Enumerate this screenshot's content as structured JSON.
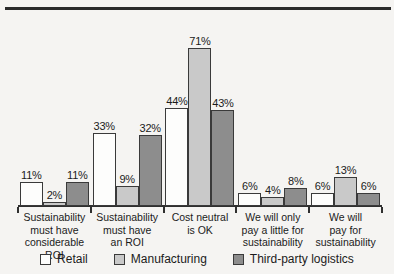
{
  "chart_data": {
    "type": "bar",
    "title": "",
    "subtitle": "",
    "xlabel": "",
    "ylabel": "",
    "grid": false,
    "legend_position": "bottom",
    "ylim": [
      0,
      80
    ],
    "value_suffix": "%",
    "categories": [
      "Sustainability must have considerable ROI",
      "Sustainability must have an ROI",
      "Cost neutral is OK",
      "We will only pay a little for sustainability",
      "We will pay for sustainability"
    ],
    "category_lines": [
      [
        "Sustainability",
        "must have",
        "considerable ROI"
      ],
      [
        "Sustainability",
        "must have",
        "an ROI"
      ],
      [
        "Cost neutral",
        "is OK"
      ],
      [
        "We will only",
        "pay a little for",
        "sustainability"
      ],
      [
        "We will",
        "pay for",
        "sustainability"
      ]
    ],
    "series": [
      {
        "name": "Retail",
        "color": "#fdfdfc",
        "values": [
          11,
          33,
          44,
          6,
          6
        ],
        "labels": [
          "11%",
          "33%",
          "44%",
          "6%",
          "6%"
        ]
      },
      {
        "name": "Manufacturing",
        "color": "#c9c9c9",
        "values": [
          2,
          9,
          71,
          4,
          13
        ],
        "labels": [
          "2%",
          "9%",
          "71%",
          "4%",
          "13%"
        ]
      },
      {
        "name": "Third-party logistics",
        "color": "#8d8d8d",
        "values": [
          11,
          32,
          43,
          8,
          6
        ],
        "labels": [
          "11%",
          "32%",
          "43%",
          "8%",
          "6%"
        ]
      }
    ],
    "legend": [
      {
        "label": "Retail",
        "color": "#fdfdfc"
      },
      {
        "label": "Manufacturing",
        "color": "#c9c9c9"
      },
      {
        "label": "Third-party logistics",
        "color": "#8d8d8d"
      }
    ]
  }
}
